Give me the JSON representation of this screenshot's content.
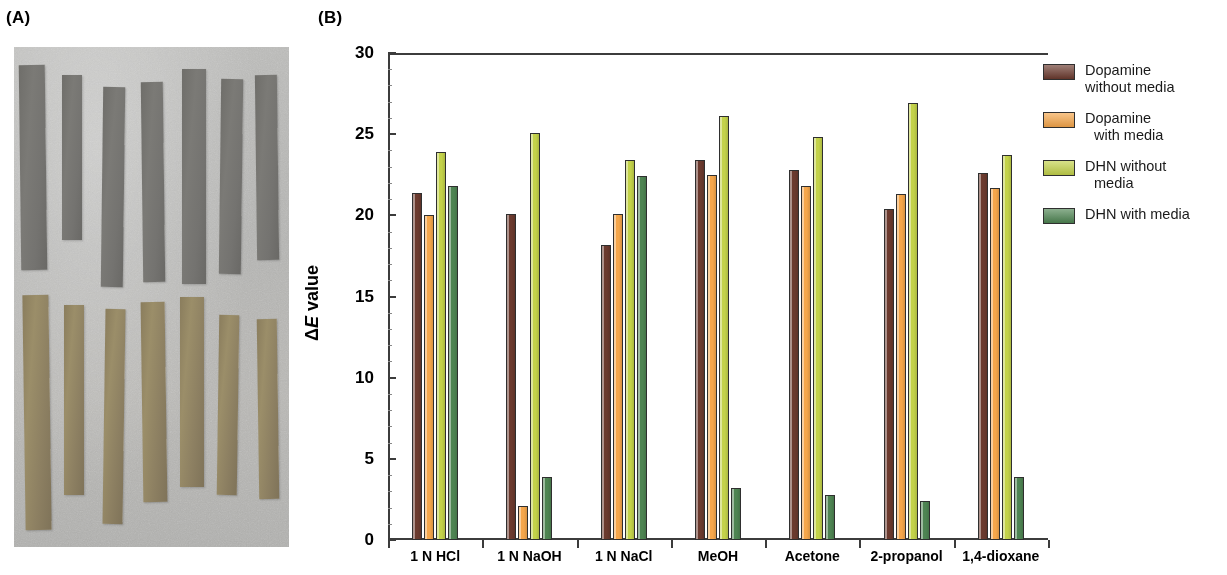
{
  "panels": {
    "a_label": "(A)",
    "b_label": "(B)"
  },
  "photo": {
    "description": "Photograph of coated substrate strips, top row untreated gray strips, bottom row brown-stained strips",
    "top_row_count": 7,
    "bottom_row_count": 7,
    "background_color": "#b4b4b2",
    "top_strip_color": "#74736f",
    "bottom_strip_color": "#8e8162"
  },
  "chart_data": {
    "type": "bar",
    "title": "",
    "xlabel": "",
    "ylabel": "ΔE value",
    "ylim": [
      0,
      30
    ],
    "yticks": [
      0,
      5,
      10,
      15,
      20,
      25,
      30
    ],
    "ytick_labels": [
      "0",
      "5",
      "10",
      "15",
      "20",
      "25",
      "30"
    ],
    "grid": false,
    "legend_position": "right",
    "categories": [
      "1 N HCl",
      "1 N NaOH",
      "1 N NaCl",
      "MeOH",
      "Acetone",
      "2-propanol",
      "1,4-dioxane"
    ],
    "series": [
      {
        "name": "Dopamine without media",
        "color": "#6B3A2E",
        "values": [
          21.4,
          20.1,
          18.2,
          23.4,
          22.8,
          20.4,
          22.6
        ]
      },
      {
        "name": "Dopamine with media",
        "color": "#F5A64B",
        "values": [
          20.0,
          2.1,
          20.1,
          22.5,
          21.8,
          21.3,
          21.7
        ]
      },
      {
        "name": "DHN without media",
        "color": "#C3D24A",
        "values": [
          23.9,
          25.1,
          23.4,
          26.1,
          24.8,
          26.9,
          23.7
        ]
      },
      {
        "name": "DHN with media",
        "color": "#4E8452",
        "values": [
          21.8,
          3.9,
          22.4,
          3.2,
          2.8,
          2.4,
          3.9
        ]
      }
    ]
  },
  "legend": {
    "items": [
      {
        "color": "#6B3A2E",
        "line1": "Dopamine",
        "line2": "without media",
        "indent": false
      },
      {
        "color": "#F5A64B",
        "line1": "Dopamine",
        "line2": "with media",
        "indent": true
      },
      {
        "color": "#C3D24A",
        "line1": "DHN without",
        "line2": "media",
        "indent": true
      },
      {
        "color": "#4E8452",
        "line1": "DHN with media",
        "line2": "",
        "indent": false
      }
    ]
  }
}
